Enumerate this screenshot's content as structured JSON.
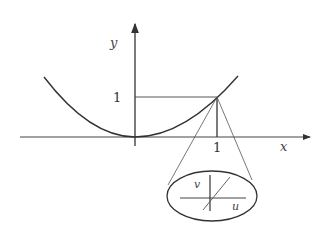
{
  "diagram": {
    "axes": {
      "x_label": "x",
      "y_label": "y"
    },
    "ticks": {
      "x_tick": "1",
      "y_tick": "1"
    },
    "curve": {
      "description": "parabola y = x^2",
      "highlighted_point": "(1, 1)"
    },
    "magnified_view": {
      "description": "zoomed ellipse showing local linear coordinates at point (1,1)",
      "u_label": "u",
      "v_label": "v"
    },
    "colors": {
      "stroke": "#333333",
      "background": "#ffffff"
    }
  }
}
